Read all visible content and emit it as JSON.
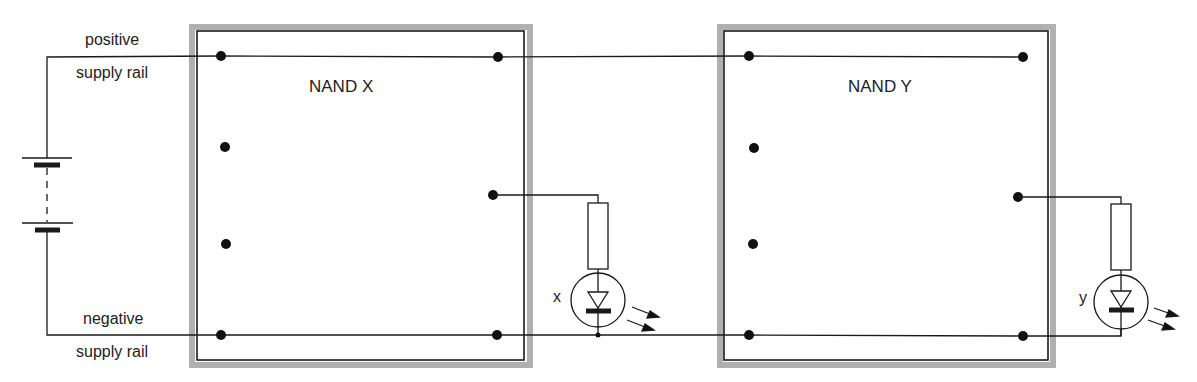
{
  "labels": {
    "positive_rail_line1": "positive",
    "positive_rail_line2": "supply rail",
    "negative_rail_line1": "negative",
    "negative_rail_line2": "supply rail",
    "gate_x_title": "NAND X",
    "gate_y_title": "NAND Y",
    "led_x_label": "x",
    "led_y_label": "y"
  },
  "components": {
    "battery": {
      "type": "battery",
      "cells": 2
    },
    "gates": [
      {
        "name": "NAND X",
        "pins": 7,
        "output_to": "LED x"
      },
      {
        "name": "NAND Y",
        "pins": 7,
        "output_to": "LED y"
      }
    ],
    "leds": [
      {
        "label": "x",
        "series_resistor": true
      },
      {
        "label": "y",
        "series_resistor": true
      }
    ]
  },
  "colors": {
    "line": "#1a1a1a",
    "board_shadow": "#a8a8a8",
    "background": "#ffffff"
  }
}
